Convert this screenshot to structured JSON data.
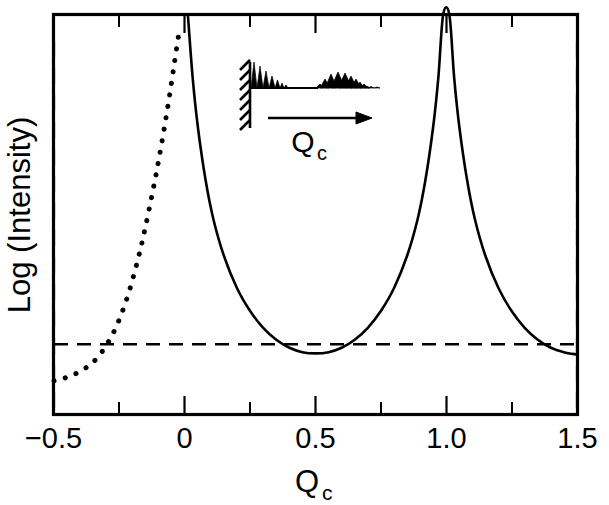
{
  "chart_data": {
    "type": "line",
    "title": "",
    "xlabel": "Q_c",
    "xlabel_base": "Q",
    "xlabel_subscript": "c",
    "ylabel": "Log (Intensity)",
    "xlim": [
      -0.5,
      1.5
    ],
    "ylim": [
      0,
      1
    ],
    "grid": false,
    "legend": null,
    "x_ticks_major": [
      -0.5,
      0,
      0.5,
      1.0,
      1.5
    ],
    "x_tick_labels": [
      "−0.5",
      "0",
      "0.5",
      "1.0",
      "1.5"
    ],
    "x_ticks_minor": [
      -0.25,
      0.25,
      0.75,
      1.25
    ],
    "y_ticks_count": 15,
    "y_tick_labels": [],
    "annotations": [
      {
        "name": "reference-level-dashed-line",
        "type": "horizontal-dashed-line",
        "y_value": 0.175,
        "style": "dashed"
      }
    ],
    "series": [
      {
        "name": "dotted-branch",
        "style": "dotted",
        "x_range": [
          -0.5,
          -0.02
        ],
        "description": "Decaying truncation-rod intensity left of the first Bragg peak; diverges at Qc = 0",
        "points": [
          [
            -0.5,
            0.083
          ],
          [
            -0.46,
            0.09
          ],
          [
            -0.42,
            0.1
          ],
          [
            -0.38,
            0.115
          ],
          [
            -0.34,
            0.137
          ],
          [
            -0.3,
            0.172
          ],
          [
            -0.26,
            0.222
          ],
          [
            -0.22,
            0.292
          ],
          [
            -0.18,
            0.385
          ],
          [
            -0.15,
            0.47
          ],
          [
            -0.12,
            0.566
          ],
          [
            -0.1,
            0.635
          ],
          [
            -0.08,
            0.71
          ],
          [
            -0.06,
            0.79
          ],
          [
            -0.04,
            0.878
          ],
          [
            -0.02,
            0.965
          ]
        ]
      },
      {
        "name": "solid-branch",
        "style": "solid",
        "x_range": [
          0.0,
          1.5
        ],
        "description": "Crystal truncation rod: diverges at Bragg peaks Qc = 0 and Qc = 1, minimum at Qc = 0.5",
        "points": [
          [
            0.012,
            1.0
          ],
          [
            0.03,
            0.845
          ],
          [
            0.05,
            0.72
          ],
          [
            0.08,
            0.585
          ],
          [
            0.11,
            0.487
          ],
          [
            0.15,
            0.396
          ],
          [
            0.2,
            0.315
          ],
          [
            0.25,
            0.258
          ],
          [
            0.3,
            0.216
          ],
          [
            0.35,
            0.186
          ],
          [
            0.4,
            0.166
          ],
          [
            0.45,
            0.155
          ],
          [
            0.5,
            0.152
          ],
          [
            0.55,
            0.155
          ],
          [
            0.6,
            0.166
          ],
          [
            0.65,
            0.186
          ],
          [
            0.7,
            0.216
          ],
          [
            0.75,
            0.258
          ],
          [
            0.8,
            0.315
          ],
          [
            0.85,
            0.396
          ],
          [
            0.89,
            0.487
          ],
          [
            0.92,
            0.585
          ],
          [
            0.95,
            0.72
          ],
          [
            0.97,
            0.845
          ],
          [
            0.988,
            1.0
          ],
          [
            1.012,
            1.0
          ],
          [
            1.03,
            0.845
          ],
          [
            1.05,
            0.72
          ],
          [
            1.08,
            0.585
          ],
          [
            1.11,
            0.487
          ],
          [
            1.15,
            0.396
          ],
          [
            1.2,
            0.315
          ],
          [
            1.25,
            0.258
          ],
          [
            1.3,
            0.216
          ],
          [
            1.35,
            0.186
          ],
          [
            1.4,
            0.166
          ],
          [
            1.45,
            0.155
          ],
          [
            1.5,
            0.149
          ]
        ]
      }
    ]
  },
  "inset": {
    "name": "surface-truncation-schematic",
    "label_base": "Q",
    "label_subscript": "c",
    "arrow_direction": "right",
    "description": "Hatched substrate wall with decaying atomic-layer spikes"
  }
}
